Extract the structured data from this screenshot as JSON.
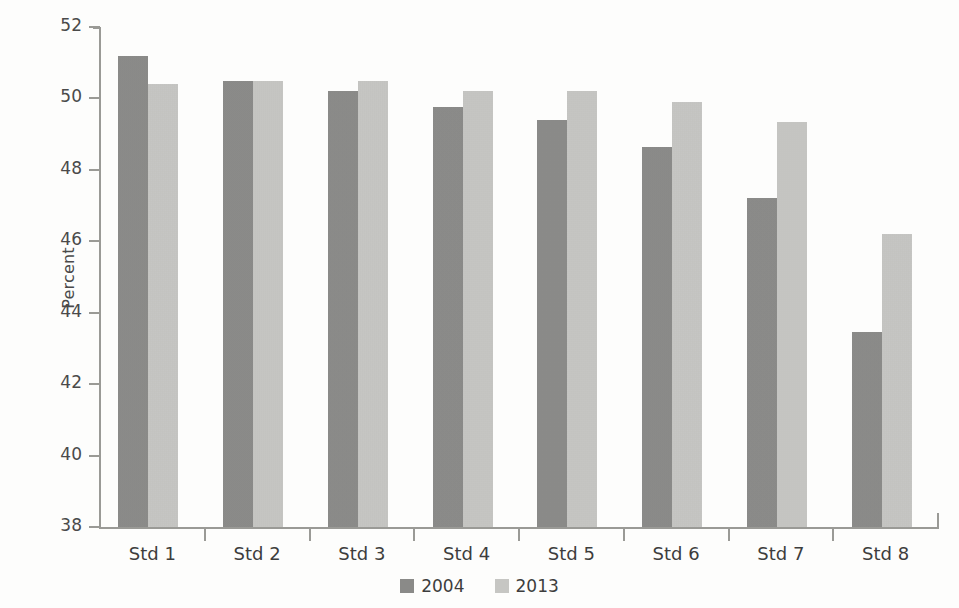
{
  "chart_data": {
    "type": "bar",
    "title": "",
    "subtitle": "",
    "xlabel": "",
    "ylabel": "Percent",
    "ylim": [
      38,
      52
    ],
    "yticks": [
      38,
      40,
      42,
      44,
      46,
      48,
      50,
      52
    ],
    "ytick_labels": [
      "38",
      "40",
      "42",
      "44",
      "46",
      "48",
      "50",
      "52"
    ],
    "grid": false,
    "legend_position": "bottom-center",
    "categories": [
      "Std 1",
      "Std 2",
      "Std 3",
      "Std 4",
      "Std 5",
      "Std 6",
      "Std 7",
      "Std 8"
    ],
    "series": [
      {
        "name": "2004",
        "color": "#8a8a88",
        "values": [
          51.2,
          50.5,
          50.2,
          49.75,
          49.4,
          48.65,
          47.2,
          43.45
        ]
      },
      {
        "name": "2013",
        "color": "#c6c6c3",
        "values": [
          50.4,
          50.5,
          50.5,
          50.2,
          50.2,
          49.9,
          49.35,
          46.2
        ]
      }
    ]
  },
  "legend": {
    "items": [
      {
        "label": "2004",
        "swatch": "dark-gray-square"
      },
      {
        "label": "2013",
        "swatch": "light-gray-square"
      }
    ]
  }
}
